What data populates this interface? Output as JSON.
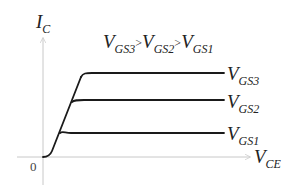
{
  "diagram": {
    "y_axis": {
      "label_main": "I",
      "label_sub": "C"
    },
    "x_axis": {
      "label_main": "V",
      "label_sub": "CE"
    },
    "origin_label": "0",
    "relation": {
      "v3_main": "V",
      "v3_sub": "GS3",
      "gt1": ">",
      "v2_main": "V",
      "v2_sub": "GS2",
      "gt2": ">",
      "v1_main": "V",
      "v1_sub": "GS1"
    },
    "curves": [
      {
        "label_main": "V",
        "label_sub": "GS3"
      },
      {
        "label_main": "V",
        "label_sub": "GS2"
      },
      {
        "label_main": "V",
        "label_sub": "GS1"
      }
    ],
    "colors": {
      "axis": "#c8c8c8",
      "curve": "#1a1a1a",
      "text": "#222222"
    }
  }
}
